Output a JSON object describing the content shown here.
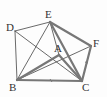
{
  "diagram": {
    "type": "geometry-figure",
    "points": {
      "A": {
        "x": 59,
        "y": 55,
        "label": "A",
        "lx": 54,
        "ly": 52
      },
      "B": {
        "x": 17,
        "y": 80,
        "label": "B",
        "lx": 9,
        "ly": 91
      },
      "C": {
        "x": 82,
        "y": 81,
        "label": "C",
        "lx": 82,
        "ly": 91
      },
      "D": {
        "x": 15,
        "y": 31,
        "label": "D",
        "lx": 6,
        "ly": 31
      },
      "E": {
        "x": 50,
        "y": 22,
        "label": "E",
        "lx": 45,
        "ly": 18
      },
      "F": {
        "x": 91,
        "y": 46,
        "label": "F",
        "lx": 93,
        "ly": 47
      }
    },
    "thin_segments": [
      [
        "D",
        "E"
      ],
      [
        "D",
        "B"
      ],
      [
        "D",
        "C"
      ],
      [
        "E",
        "B"
      ],
      [
        "B",
        "F"
      ],
      [
        "E",
        "A"
      ]
    ],
    "thick_segments": [
      [
        "E",
        "F"
      ],
      [
        "F",
        "C"
      ],
      [
        "E",
        "C"
      ],
      [
        "B",
        "C"
      ],
      [
        "B",
        "A"
      ],
      [
        "A",
        "C"
      ]
    ],
    "colors": {
      "thin": "#444444",
      "thick": "#777777",
      "label": "#333333"
    }
  }
}
